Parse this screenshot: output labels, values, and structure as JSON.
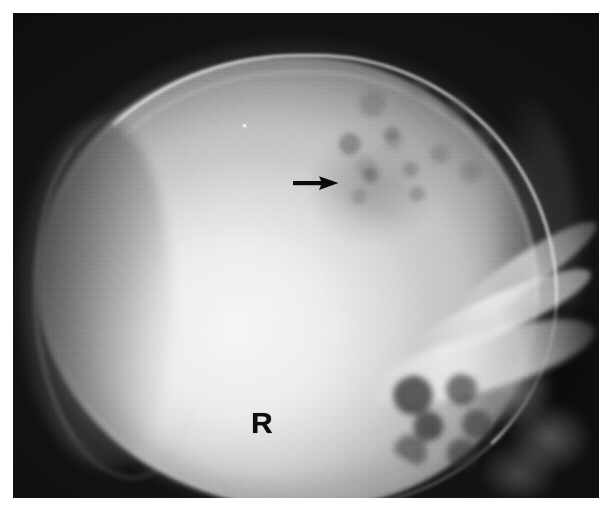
{
  "figure": {
    "kind": "radiograph",
    "modality": "plain-film-x-ray",
    "view": "lateral skull",
    "caption": "",
    "plate": {
      "left": 13,
      "top": 13,
      "width": 586,
      "height": 485,
      "border_color": "#ffffff",
      "background_color": "#0c0c0c"
    }
  },
  "annotations": {
    "side_marker": {
      "name": "right-side-marker",
      "text": "R",
      "color": "#0d0d0d",
      "x": 251,
      "y": 408,
      "font_size_px": 30,
      "weight": "bold"
    },
    "arrow": {
      "name": "lesion-pointer-arrow",
      "direction": "right",
      "color": "#0a0a0a",
      "x": 293,
      "y": 175,
      "length_px": 46,
      "head_width_px": 14,
      "shaft_thickness_px": 4,
      "points_to": "lytic lesion in the parietal calvarium"
    }
  },
  "anatomy": {
    "regions": [
      {
        "name": "cranial-vault",
        "label": "Cranial vault (calvarium)"
      },
      {
        "name": "outer-table",
        "label": "Outer table of skull"
      },
      {
        "name": "inner-table",
        "label": "Inner table of skull"
      },
      {
        "name": "diploic-space",
        "label": "Diploic space"
      },
      {
        "name": "occipital-soft-tissue",
        "label": "Posterior soft tissue shadow"
      },
      {
        "name": "lytic-lesion",
        "label": "Lucent / mottled lesion"
      },
      {
        "name": "petrous-ridge",
        "label": "Petrous ridge"
      },
      {
        "name": "sphenoid-ridge",
        "label": "Greater sphenoid wing"
      },
      {
        "name": "orbital-roof",
        "label": "Orbital roof"
      },
      {
        "name": "mastoid-air-cells",
        "label": "Mastoid air cells"
      },
      {
        "name": "facial-bones",
        "label": "Facial bones"
      }
    ]
  },
  "palette": {
    "film_black": "#0c0c0c",
    "background_white": "#ffffff",
    "bone_bright": "#ebebeb",
    "bone_mid": "#b4b4b4",
    "soft_tissue": "#6e6e6e",
    "annotation_black": "#0d0d0d"
  },
  "specks": [
    {
      "name": "emulsion-speck",
      "x": 243,
      "y": 124
    },
    {
      "name": "emulsion-speck",
      "x": 262,
      "y": 388
    }
  ]
}
